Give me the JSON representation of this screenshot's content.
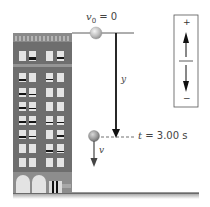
{
  "figure": {
    "labels": {
      "initial_velocity": {
        "symbol": "v",
        "subscript": "0",
        "equals": " = 0"
      },
      "displacement": "y",
      "time": {
        "symbol": "t",
        "equals": " = 3.00 s"
      },
      "velocity": "v"
    },
    "sign_convention": {
      "positive": "+",
      "negative": "−",
      "up_meaning": "positive",
      "down_meaning": "negative"
    },
    "colors": {
      "building": "#6e6e6e",
      "building_dark": "#5a5a5a",
      "window": "#e6e6e6",
      "ball": "#b8b8b8",
      "lines": "#222222",
      "ground_shadow": "#bdbdbd"
    }
  }
}
